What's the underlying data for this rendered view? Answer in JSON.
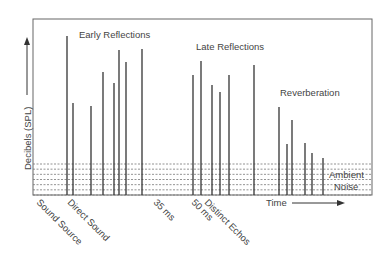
{
  "diagram": {
    "y_axis_label": "Decibels (SPL)",
    "x_axis_label": "Time",
    "region_labels": {
      "early": "Early Reflections",
      "late": "Late Reflections",
      "reverb": "Reverberation",
      "ambient_line1": "Ambient",
      "ambient_line2": "Noise"
    },
    "x_tick_labels": [
      {
        "text": "Sound Source",
        "x": 36
      },
      {
        "text": "Direct Sound",
        "x": 67
      },
      {
        "text": "35 ms",
        "x": 153
      },
      {
        "text": "50 ms",
        "x": 191
      },
      {
        "text": "Distinct Echos",
        "x": 204
      }
    ],
    "colors": {
      "line": "#333333",
      "frame": "#666666",
      "noise": "#777777"
    }
  },
  "chart_data": {
    "type": "bar",
    "title": "",
    "xlabel": "Time",
    "ylabel": "Decibels (SPL)",
    "series": [
      {
        "name": "Direct Sound",
        "values": [
          {
            "x": 67,
            "top": 36
          }
        ]
      },
      {
        "name": "Early Reflections",
        "values": [
          {
            "x": 73,
            "top": 103
          },
          {
            "x": 91,
            "top": 106
          },
          {
            "x": 103,
            "top": 72
          },
          {
            "x": 114,
            "top": 83
          },
          {
            "x": 119,
            "top": 50
          },
          {
            "x": 126,
            "top": 62
          },
          {
            "x": 142,
            "top": 49
          }
        ]
      },
      {
        "name": "Late Reflections",
        "values": [
          {
            "x": 193,
            "top": 75
          },
          {
            "x": 201,
            "top": 61
          },
          {
            "x": 212,
            "top": 85
          },
          {
            "x": 220,
            "top": 92
          },
          {
            "x": 229,
            "top": 75
          },
          {
            "x": 254,
            "top": 65
          }
        ]
      },
      {
        "name": "Reverberation",
        "values": [
          {
            "x": 279,
            "top": 107
          },
          {
            "x": 287,
            "top": 144
          },
          {
            "x": 292,
            "top": 120
          },
          {
            "x": 305,
            "top": 143
          },
          {
            "x": 312,
            "top": 153
          },
          {
            "x": 323,
            "top": 158
          }
        ]
      }
    ],
    "ambient_noise_band": {
      "top": 164,
      "bottom": 195,
      "lines": 7
    }
  }
}
